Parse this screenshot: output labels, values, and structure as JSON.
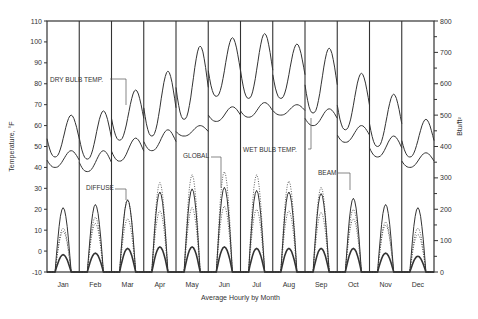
{
  "chart_data": {
    "type": "line",
    "title": "",
    "xlabel": "Average Hourly by Month",
    "ylabel": "Temperature, °F",
    "ylabel_right": "Btu/ft²",
    "ylim": [
      -10,
      110
    ],
    "ylim_right": [
      0,
      800
    ],
    "yticks": [
      -10,
      0,
      10,
      20,
      30,
      40,
      50,
      60,
      70,
      80,
      90,
      100,
      110
    ],
    "yticks_right": [
      0,
      100,
      200,
      300,
      400,
      500,
      600,
      700,
      800
    ],
    "categories": [
      "Jan",
      "Feb",
      "Mar",
      "Apr",
      "May",
      "Jun",
      "Jul",
      "Aug",
      "Sep",
      "Oct",
      "Nov",
      "Dec"
    ],
    "grid": false,
    "series": [
      {
        "name": "DRY BULB TEMP.",
        "axis": "left",
        "style": "solid",
        "min": [
          45,
          44,
          53,
          55,
          63,
          74,
          73,
          73,
          66,
          58,
          50,
          45
        ],
        "max": [
          65,
          67,
          77,
          86,
          98,
          102,
          104,
          99,
          97,
          85,
          75,
          63
        ]
      },
      {
        "name": "WET BULB TEMP.",
        "axis": "left",
        "style": "solid",
        "min": [
          40,
          38,
          43,
          48,
          55,
          62,
          64,
          65,
          60,
          52,
          45,
          40
        ],
        "max": [
          48,
          48,
          54,
          58,
          60,
          69,
          71,
          70,
          68,
          60,
          55,
          47
        ]
      },
      {
        "name": "GLOBAL",
        "axis": "right",
        "style": "solid",
        "max": [
          205,
          215,
          230,
          255,
          265,
          270,
          260,
          255,
          250,
          235,
          215,
          205
        ]
      },
      {
        "name": "DIFFUSE",
        "axis": "right",
        "style": "dotted",
        "max": [
          130,
          175,
          230,
          285,
          310,
          320,
          310,
          290,
          270,
          200,
          160,
          120
        ]
      },
      {
        "name": "BEAM",
        "axis": "right",
        "style": "dotted",
        "max": [
          140,
          155,
          170,
          195,
          205,
          210,
          200,
          195,
          190,
          170,
          150,
          140
        ]
      },
      {
        "name": "Direct normal",
        "axis": "right",
        "style": "solid-heavy",
        "max": [
          55,
          60,
          75,
          80,
          80,
          80,
          75,
          75,
          75,
          75,
          60,
          50
        ]
      }
    ],
    "annotations": [
      "DRY BULB TEMP.",
      "WET BULB TEMP.",
      "GLOBAL",
      "DIFFUSE",
      "BEAM"
    ]
  }
}
